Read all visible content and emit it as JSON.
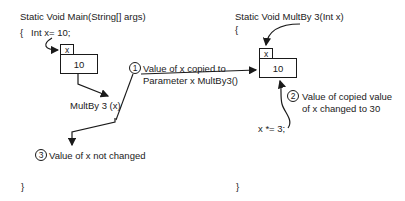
{
  "main_method": {
    "signature": "Static Void Main(String[] args)",
    "open_brace": "{",
    "declaration": "Int x= 10;",
    "var_label": "x",
    "var_value": "10",
    "call": "MultBy 3 (x)",
    "close_brace": "}"
  },
  "multby_method": {
    "signature": "Static Void MultBy 3(Int x)",
    "open_brace": "{",
    "var_label": "x",
    "var_value": "10",
    "statement": "x *= 3;",
    "close_brace": "}"
  },
  "annotations": [
    {
      "number": "1",
      "line1": "Value of x copied to",
      "line2": "Parameter x MultBy3()"
    },
    {
      "number": "2",
      "line1": "Value of copied value",
      "line2": "of x changed to 30"
    },
    {
      "number": "3",
      "line1": "Value of x not changed"
    }
  ],
  "colors": {
    "ink": "#1a1a1a",
    "background": "#ffffff"
  }
}
